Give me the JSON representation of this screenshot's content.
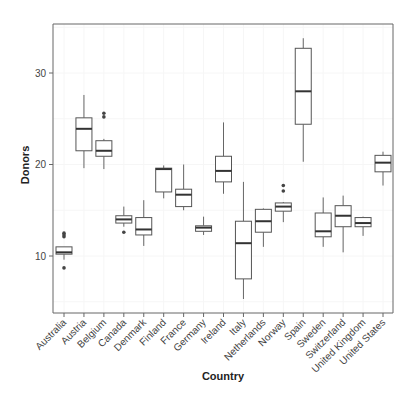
{
  "chart_data": {
    "type": "boxplot",
    "title": "",
    "xlabel": "Country",
    "ylabel": "Donors",
    "ylim": [
      3.8,
      35.3
    ],
    "yticks": [
      10,
      20,
      30
    ],
    "grid": true,
    "legend": null,
    "categories": [
      "Australia",
      "Austria",
      "Belgium",
      "Canada",
      "Denmark",
      "Finland",
      "France",
      "Germany",
      "Ireland",
      "Italy",
      "Netherlands",
      "Norway",
      "Spain",
      "Sweden",
      "Switzerland",
      "United Kingdom",
      "United States"
    ],
    "boxes": [
      {
        "category": "Australia",
        "whisker_low": 9.6,
        "q1": 10.2,
        "median": 10.4,
        "q3": 11.0,
        "whisker_high": 11.0,
        "outliers": [
          8.7,
          12.1,
          12.3,
          12.5
        ]
      },
      {
        "category": "Austria",
        "whisker_low": 19.6,
        "q1": 21.5,
        "median": 23.9,
        "q3": 25.1,
        "whisker_high": 27.6,
        "outliers": []
      },
      {
        "category": "Belgium",
        "whisker_low": 19.5,
        "q1": 20.9,
        "median": 21.5,
        "q3": 22.6,
        "whisker_high": 22.8,
        "outliers": [
          25.2,
          25.6
        ]
      },
      {
        "category": "Canada",
        "whisker_low": 13.2,
        "q1": 13.6,
        "median": 14.0,
        "q3": 14.4,
        "whisker_high": 15.4,
        "outliers": [
          12.6
        ]
      },
      {
        "category": "Denmark",
        "whisker_low": 11.1,
        "q1": 12.3,
        "median": 12.9,
        "q3": 14.2,
        "whisker_high": 16.1,
        "outliers": []
      },
      {
        "category": "Finland",
        "whisker_low": 16.3,
        "q1": 17.0,
        "median": 19.5,
        "q3": 19.6,
        "whisker_high": 19.9,
        "outliers": []
      },
      {
        "category": "France",
        "whisker_low": 15.0,
        "q1": 15.4,
        "median": 16.7,
        "q3": 17.3,
        "whisker_high": 20.0,
        "outliers": []
      },
      {
        "category": "Germany",
        "whisker_low": 12.3,
        "q1": 12.7,
        "median": 13.1,
        "q3": 13.3,
        "whisker_high": 14.3,
        "outliers": []
      },
      {
        "category": "Ireland",
        "whisker_low": 16.8,
        "q1": 18.1,
        "median": 19.3,
        "q3": 20.9,
        "whisker_high": 24.6,
        "outliers": []
      },
      {
        "category": "Italy",
        "whisker_low": 5.3,
        "q1": 7.5,
        "median": 11.4,
        "q3": 13.8,
        "whisker_high": 18.1,
        "outliers": []
      },
      {
        "category": "Netherlands",
        "whisker_low": 11.0,
        "q1": 12.6,
        "median": 13.8,
        "q3": 15.1,
        "whisker_high": 15.2,
        "outliers": []
      },
      {
        "category": "Norway",
        "whisker_low": 13.7,
        "q1": 14.9,
        "median": 15.4,
        "q3": 15.8,
        "whisker_high": 15.9,
        "outliers": [
          17.1,
          17.7
        ]
      },
      {
        "category": "Spain",
        "whisker_low": 20.3,
        "q1": 24.4,
        "median": 28.0,
        "q3": 32.7,
        "whisker_high": 33.8,
        "outliers": []
      },
      {
        "category": "Sweden",
        "whisker_low": 11.0,
        "q1": 12.1,
        "median": 12.7,
        "q3": 14.7,
        "whisker_high": 16.4,
        "outliers": []
      },
      {
        "category": "Switzerland",
        "whisker_low": 10.4,
        "q1": 13.2,
        "median": 14.4,
        "q3": 15.5,
        "whisker_high": 16.6,
        "outliers": []
      },
      {
        "category": "United Kingdom",
        "whisker_low": 12.2,
        "q1": 13.2,
        "median": 13.6,
        "q3": 14.2,
        "whisker_high": 14.3,
        "outliers": []
      },
      {
        "category": "United States",
        "whisker_low": 17.7,
        "q1": 19.2,
        "median": 20.2,
        "q3": 21.0,
        "whisker_high": 21.4,
        "outliers": []
      }
    ]
  },
  "style": {
    "box_stroke": "#555555",
    "median_stroke": "#333333",
    "whisker_stroke": "#666666",
    "outlier_fill": "#444444",
    "axis_stroke": "#666666",
    "grid_stroke": "#f6f6f6",
    "background": "#ffffff"
  }
}
